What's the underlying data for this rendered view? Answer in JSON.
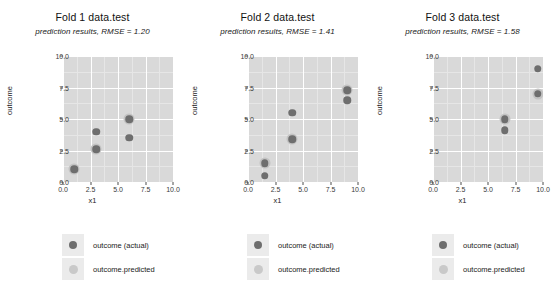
{
  "chart_data": {
    "type": "scatter",
    "layout": "facet-row",
    "n_panels": 3,
    "xlabel": "x1",
    "ylabel": "outcome",
    "xlim": [
      0.0,
      10.0
    ],
    "ylim": [
      0.0,
      10.0
    ],
    "xticks": [
      "0.0",
      "2.5",
      "5.0",
      "7.5",
      "10.0"
    ],
    "yticks": [
      "0.0",
      "2.5",
      "5.0",
      "7.5",
      "10.0"
    ],
    "xtick_values": [
      0.0,
      2.5,
      5.0,
      7.5,
      10.0
    ],
    "ytick_values": [
      0.0,
      2.5,
      5.0,
      7.5,
      10.0
    ],
    "grid": true,
    "legend_position": "bottom",
    "legend": [
      {
        "name": "outcome (actual)",
        "color": "#6e6e6e",
        "icon": "actual-dot-icon"
      },
      {
        "name": "outcome.predicted",
        "color": "#c9c9c9",
        "icon": "predicted-dot-icon"
      }
    ],
    "panels": [
      {
        "title": "Fold 1 data.test",
        "subtitle": "prediction results, RMSE = 1.20",
        "rmse": 1.2,
        "series": [
          {
            "name": "outcome.predicted",
            "points": [
              [
                1.0,
                1.0
              ],
              [
                3.0,
                2.6
              ],
              [
                6.0,
                5.0
              ]
            ]
          },
          {
            "name": "outcome (actual)",
            "points": [
              [
                1.0,
                1.0
              ],
              [
                3.0,
                2.6
              ],
              [
                3.0,
                4.0
              ],
              [
                6.0,
                5.0
              ],
              [
                6.0,
                3.5
              ]
            ]
          }
        ]
      },
      {
        "title": "Fold 2 data.test",
        "subtitle": "prediction results, RMSE = 1.41",
        "rmse": 1.41,
        "series": [
          {
            "name": "outcome.predicted",
            "points": [
              [
                1.5,
                1.5
              ],
              [
                4.0,
                3.4
              ],
              [
                9.0,
                7.3
              ]
            ]
          },
          {
            "name": "outcome (actual)",
            "points": [
              [
                1.5,
                1.5
              ],
              [
                1.5,
                0.5
              ],
              [
                4.0,
                3.4
              ],
              [
                4.0,
                5.5
              ],
              [
                9.0,
                7.3
              ],
              [
                9.0,
                6.5
              ]
            ]
          }
        ]
      },
      {
        "title": "Fold 3 data.test",
        "subtitle": "prediction results, RMSE = 1.58",
        "rmse": 1.58,
        "series": [
          {
            "name": "outcome.predicted",
            "points": [
              [
                6.5,
                5.0
              ],
              [
                9.5,
                7.0
              ]
            ]
          },
          {
            "name": "outcome (actual)",
            "points": [
              [
                6.5,
                5.0
              ],
              [
                6.5,
                4.1
              ],
              [
                9.5,
                7.0
              ],
              [
                9.5,
                9.0
              ]
            ]
          }
        ]
      }
    ],
    "colors": {
      "panel_background": "#d9d9d9",
      "gridline": "#ffffff",
      "actual": "#6e6e6e",
      "predicted": "#c3c3c3",
      "page_background": "#ffffff",
      "legend_key_background": "#ebebeb"
    }
  }
}
